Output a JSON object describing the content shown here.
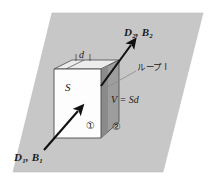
{
  "figure": {
    "background_color": "#ffffff",
    "plane": {
      "name": "interface-plane",
      "fill_color": "#c7c7c7",
      "stroke_color": "#b0b0b0",
      "points": "52,13 203,13 163,172 13,172"
    },
    "slab": {
      "front_face_color": "#fefefe",
      "top_face_color": "#e9e9e9",
      "side_face_color": "#9a9a9a",
      "edge_color": "#4a4a4a"
    },
    "arrow_color": "#111111",
    "leader_color": "#8a8a8a"
  },
  "labels": {
    "field_upper": {
      "symbol_d": "D",
      "sub_d": "2",
      "comma": ",",
      "symbol_b": "B",
      "sub_b": "2",
      "text": "D2, B2"
    },
    "field_lower": {
      "symbol_d": "D",
      "sub_d": "1",
      "comma": ",",
      "symbol_b": "B",
      "sub_b": "1",
      "text": "D1, B1"
    },
    "loop": "ループ l",
    "volume": "V = Sd",
    "area": "S",
    "thickness": "d",
    "region_one": "①",
    "region_two": "②"
  }
}
